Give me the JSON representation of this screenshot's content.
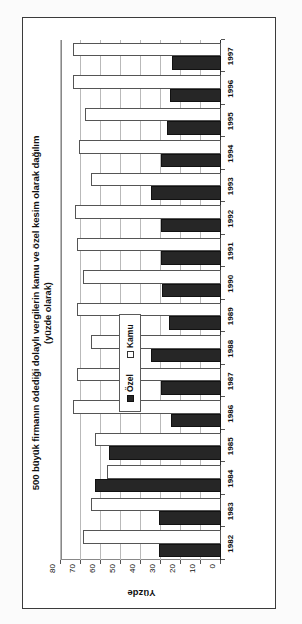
{
  "chart_data": {
    "type": "bar",
    "title": "500 büyük firmanın ödediği dolaylı vergilerin kamu ve özel kesim olarak dağılım",
    "subtitle": "(yüzde olarak)",
    "xlabel": "",
    "ylabel": "Yüzde",
    "ylim": [
      0,
      80
    ],
    "yticks": [
      0,
      10,
      20,
      30,
      40,
      50,
      60,
      70,
      80
    ],
    "ytick_labels": [
      "0",
      "10",
      "20",
      "30",
      "40",
      "50",
      "60",
      "70",
      "80"
    ],
    "grid": true,
    "orientation": "rotated-90",
    "legend_position": "inside-left",
    "categories": [
      "1982",
      "1983",
      "1984",
      "1985",
      "1986",
      "1987",
      "1988",
      "1989",
      "1990",
      "1991",
      "1992",
      "1993",
      "1994",
      "1995",
      "1996",
      "1997"
    ],
    "series": [
      {
        "name": "Özel",
        "color": "#262626",
        "values": [
          31,
          31,
          63,
          56,
          25,
          30,
          35,
          26,
          29.5,
          30,
          30,
          35,
          30,
          27,
          25.5,
          24.5
        ]
      },
      {
        "name": "Kamu",
        "color": "#ffffff",
        "values": [
          69,
          65,
          57,
          63,
          74,
          72,
          65,
          72,
          69,
          72,
          73,
          65,
          71,
          68,
          74,
          74
        ]
      }
    ]
  },
  "legend": {
    "items": [
      {
        "label": "Özel",
        "swatch": "filled-square-icon"
      },
      {
        "label": "Kamu",
        "swatch": "empty-square-icon"
      }
    ]
  }
}
